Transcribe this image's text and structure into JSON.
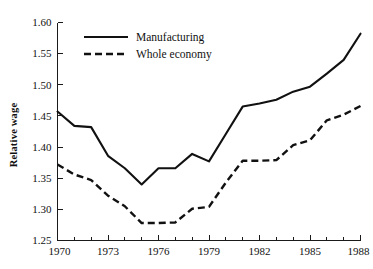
{
  "chart_data": {
    "type": "line",
    "title": "",
    "subtitle": "",
    "xlabel": "",
    "ylabel": "Relative wage",
    "xlim": [
      1970,
      1988
    ],
    "ylim": [
      1.25,
      1.6
    ],
    "grid": false,
    "legend_position": "top-left-inside",
    "x": [
      1970,
      1971,
      1972,
      1973,
      1974,
      1975,
      1976,
      1977,
      1978,
      1979,
      1980,
      1981,
      1982,
      1983,
      1984,
      1985,
      1986,
      1987,
      1988
    ],
    "xtick_labels": [
      "1970",
      "1973",
      "1976",
      "1979",
      "1982",
      "1985",
      "1988"
    ],
    "xticks_major": [
      1970,
      1973,
      1976,
      1979,
      1982,
      1985,
      1988
    ],
    "xticks_minor": [
      1971,
      1972,
      1974,
      1975,
      1977,
      1978,
      1980,
      1981,
      1983,
      1984,
      1986,
      1987
    ],
    "ytick_labels": [
      "1.25",
      "1.30",
      "1.35",
      "1.40",
      "1.45",
      "1.50",
      "1.55",
      "1.60"
    ],
    "yticks": [
      1.25,
      1.3,
      1.35,
      1.4,
      1.45,
      1.5,
      1.55,
      1.6
    ],
    "series": [
      {
        "name": "Manufacturing",
        "style": "solid",
        "color": "#111111",
        "values": [
          1.457,
          1.434,
          1.432,
          1.386,
          1.366,
          1.34,
          1.366,
          1.366,
          1.389,
          1.377,
          1.421,
          1.465,
          1.47,
          1.476,
          1.489,
          1.497,
          1.518,
          1.54,
          1.582
        ]
      },
      {
        "name": "Whole economy",
        "style": "dashed",
        "color": "#111111",
        "values": [
          1.372,
          1.356,
          1.347,
          1.322,
          1.305,
          1.278,
          1.278,
          1.279,
          1.301,
          1.304,
          1.343,
          1.378,
          1.378,
          1.379,
          1.403,
          1.411,
          1.443,
          1.452,
          1.466
        ]
      }
    ],
    "legend": [
      {
        "label": "Manufacturing",
        "style": "solid"
      },
      {
        "label": "Whole economy",
        "style": "dashed"
      }
    ]
  },
  "axes": {
    "y_title": "Relative wage"
  }
}
